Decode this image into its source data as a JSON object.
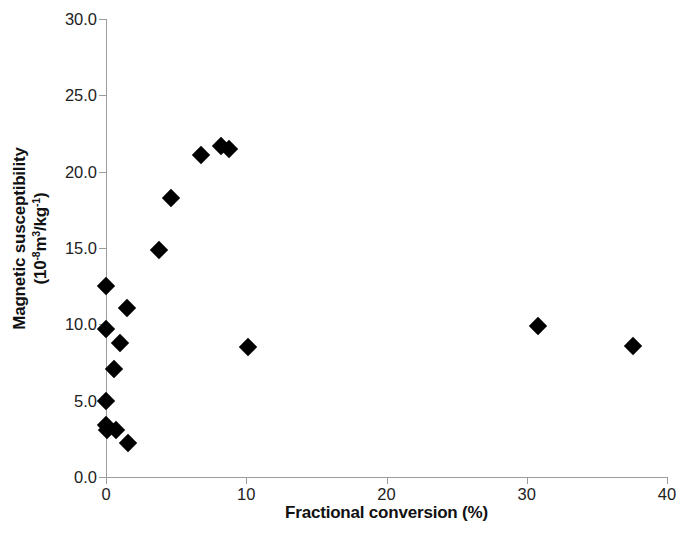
{
  "chart_data": {
    "type": "scatter",
    "title": "",
    "subtitle": "",
    "xlabel": "Fractional conversion (%)",
    "ylabel_line1": "Magnetic susceptibility",
    "ylabel_line2": "(10-8m3/kg-1)",
    "ylabel_full": "Magnetic susceptibility (10-8m3/kg-1)",
    "xlim": [
      0,
      40
    ],
    "ylim": [
      0,
      30
    ],
    "xticks": [
      0,
      10,
      20,
      30,
      40
    ],
    "yticks": [
      0.0,
      5.0,
      10.0,
      15.0,
      20.0,
      25.0,
      30.0
    ],
    "xtick_labels": [
      "0",
      "10",
      "20",
      "30",
      "40"
    ],
    "ytick_labels": [
      "0.0",
      "5.0",
      "10.0",
      "15.0",
      "20.0",
      "25.0",
      "30.0"
    ],
    "grid": false,
    "legend": null,
    "marker": "diamond",
    "marker_color": "#000000",
    "series": [
      {
        "name": "samples",
        "points": [
          {
            "x": 0.0,
            "y": 12.5
          },
          {
            "x": 1.5,
            "y": 11.1
          },
          {
            "x": 0.0,
            "y": 9.7
          },
          {
            "x": 1.0,
            "y": 8.8
          },
          {
            "x": 0.6,
            "y": 7.1
          },
          {
            "x": 0.0,
            "y": 5.0
          },
          {
            "x": 0.0,
            "y": 3.4
          },
          {
            "x": 0.1,
            "y": 3.1
          },
          {
            "x": 0.7,
            "y": 3.1
          },
          {
            "x": 1.6,
            "y": 2.2
          },
          {
            "x": 3.8,
            "y": 14.9
          },
          {
            "x": 4.6,
            "y": 18.3
          },
          {
            "x": 6.8,
            "y": 21.1
          },
          {
            "x": 8.2,
            "y": 21.7
          },
          {
            "x": 8.8,
            "y": 21.5
          },
          {
            "x": 10.1,
            "y": 8.5
          },
          {
            "x": 30.8,
            "y": 9.9
          },
          {
            "x": 37.6,
            "y": 8.6
          }
        ]
      }
    ]
  }
}
